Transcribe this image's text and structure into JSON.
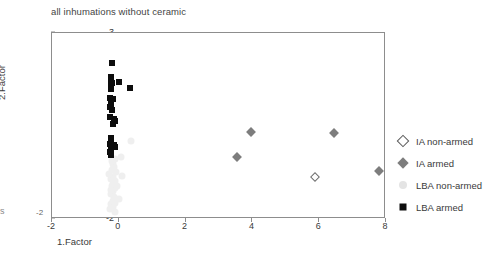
{
  "chart": {
    "title": "all inhumations without ceramic",
    "xlabel": "1.Factor",
    "ylabel": "2.Factor",
    "edge_fragment": "s",
    "y_corner_label": "-2"
  },
  "axes": {
    "x_ticks": [
      "-2",
      "0",
      "2",
      "4",
      "6",
      "8"
    ],
    "y_ticks": [
      "3",
      "2",
      "1",
      "0",
      "-1",
      "-2"
    ]
  },
  "legend": {
    "items": [
      {
        "label": "IA non-armed",
        "marker": "diamond-open",
        "color": "#ffffff"
      },
      {
        "label": "IA armed",
        "marker": "diamond-filled",
        "color": "#7d7d7d"
      },
      {
        "label": "LBA non-armed",
        "marker": "circle-filled",
        "color": "#e4e4e4"
      },
      {
        "label": "LBA armed",
        "marker": "square-filled",
        "color": "#0d0d0d"
      }
    ]
  },
  "chart_data": {
    "type": "scatter",
    "title": "all inhumations without ceramic",
    "xlabel": "1.Factor",
    "ylabel": "2.Factor",
    "xlim": [
      -2,
      8
    ],
    "ylim": [
      -2,
      3
    ],
    "xticks": [
      -2,
      0,
      2,
      4,
      6,
      8
    ],
    "yticks": [
      -2,
      -1,
      0,
      1,
      2,
      3
    ],
    "grid": false,
    "legend_position": "right",
    "series": [
      {
        "name": "IA non-armed",
        "marker": "diamond-open",
        "color": "#ffffff",
        "edgecolor": "#6f6f6f",
        "points": [
          [
            5.88,
            -0.86
          ]
        ]
      },
      {
        "name": "IA armed",
        "marker": "diamond-filled",
        "color": "#7d7d7d",
        "points": [
          [
            3.96,
            0.34
          ],
          [
            3.55,
            -0.32
          ],
          [
            6.45,
            0.32
          ],
          [
            7.78,
            -0.7
          ]
        ]
      },
      {
        "name": "LBA non-armed",
        "marker": "circle-filled",
        "color": "#e4e4e4",
        "points": [
          [
            0.38,
            0.09
          ],
          [
            0.08,
            -0.33
          ],
          [
            -0.12,
            -0.4
          ],
          [
            -0.18,
            -0.52
          ],
          [
            -0.14,
            -0.6
          ],
          [
            -0.2,
            -0.68
          ],
          [
            -0.08,
            -0.74
          ],
          [
            0.1,
            -0.85
          ],
          [
            -0.18,
            -0.86
          ],
          [
            -0.22,
            -0.92
          ],
          [
            -0.1,
            -0.98
          ],
          [
            -0.16,
            -1.05
          ],
          [
            -0.2,
            -1.12
          ],
          [
            -0.12,
            -1.18
          ],
          [
            -0.18,
            -1.26
          ],
          [
            -0.22,
            -1.33
          ],
          [
            -0.14,
            -1.4
          ],
          [
            0.02,
            -1.47
          ],
          [
            -0.18,
            -1.52
          ],
          [
            -0.24,
            -1.6
          ],
          [
            -0.16,
            -1.68
          ],
          [
            -0.26,
            -1.74
          ],
          [
            -0.12,
            -1.8
          ],
          [
            -0.2,
            -0.45
          ],
          [
            -0.24,
            -1.22
          ],
          [
            -0.1,
            -1.58
          ],
          [
            -0.3,
            -0.78
          ],
          [
            -0.06,
            -1.1
          ]
        ]
      },
      {
        "name": "LBA armed",
        "marker": "square-filled",
        "color": "#0d0d0d",
        "points": [
          [
            -0.2,
            2.2
          ],
          [
            -0.22,
            1.82
          ],
          [
            -0.24,
            1.72
          ],
          [
            -0.2,
            1.66
          ],
          [
            0.0,
            1.68
          ],
          [
            -0.24,
            1.58
          ],
          [
            0.34,
            1.52
          ],
          [
            -0.22,
            1.5
          ],
          [
            -0.26,
            1.26
          ],
          [
            -0.18,
            1.22
          ],
          [
            -0.24,
            1.16
          ],
          [
            -0.22,
            1.08
          ],
          [
            -0.26,
            1.0
          ],
          [
            -0.2,
            0.93
          ],
          [
            -0.26,
            0.74
          ],
          [
            -0.14,
            0.7
          ],
          [
            -0.1,
            0.64
          ],
          [
            -0.18,
            0.56
          ],
          [
            -0.24,
            0.18
          ],
          [
            -0.22,
            0.1
          ],
          [
            -0.26,
            0.02
          ],
          [
            -0.14,
            -0.02
          ],
          [
            -0.1,
            -0.06
          ],
          [
            -0.24,
            -0.12
          ],
          [
            -0.26,
            -0.2
          ],
          [
            -0.22,
            -0.28
          ]
        ]
      }
    ]
  }
}
